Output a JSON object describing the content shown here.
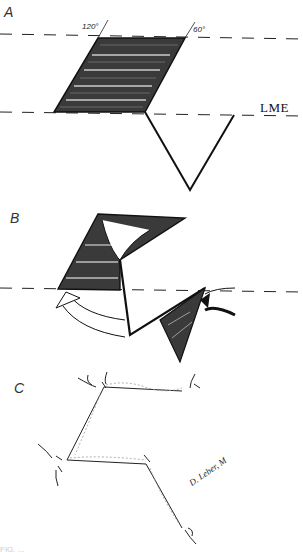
{
  "figure": {
    "panels": [
      {
        "id": "A",
        "label": "A",
        "angles": {
          "left": "120°",
          "right": "60°"
        },
        "reference_line_label": "LME"
      },
      {
        "id": "B",
        "label": "B"
      },
      {
        "id": "C",
        "label": "C",
        "signature": "D. Leber, M"
      }
    ],
    "caption_fragment": "FIG. ..."
  },
  "colors": {
    "ink": "#111111",
    "background": "#ffffff",
    "hatch": "#2a2a2a",
    "suture_dots": "#999999"
  }
}
